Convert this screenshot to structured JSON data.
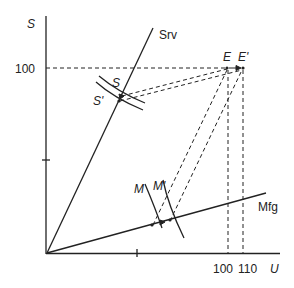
{
  "diagram": {
    "axes": {
      "y_label": "S",
      "x_label": "U",
      "y_tick_label": "100",
      "x_tick_labels": [
        "100",
        "110"
      ]
    },
    "rays": {
      "services": "Srv",
      "manufacturing": "Mfg"
    },
    "points": {
      "S": "S",
      "S_prime": "S'",
      "M": "M",
      "M_prime": "M'",
      "E": "E",
      "E_prime": "E'"
    },
    "colors": {
      "line": "#222222",
      "background": "#ffffff"
    }
  }
}
